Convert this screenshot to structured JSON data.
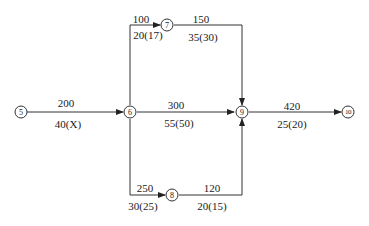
{
  "diagram": {
    "type": "network-diagram",
    "nodes": [
      {
        "id": "5",
        "label": "5"
      },
      {
        "id": "6",
        "label": "6"
      },
      {
        "id": "7",
        "label": "7"
      },
      {
        "id": "8",
        "label": "8"
      },
      {
        "id": "9",
        "label": "9"
      },
      {
        "id": "10",
        "label": "10"
      }
    ],
    "edges": [
      {
        "from": "5",
        "to": "6",
        "cost": "200",
        "duration": "40(X)"
      },
      {
        "from": "6",
        "to": "7",
        "cost": "100",
        "duration": "20(17)"
      },
      {
        "from": "7",
        "to": "9",
        "cost": "150",
        "duration": "35(30)"
      },
      {
        "from": "6",
        "to": "9",
        "cost": "300",
        "duration": "55(50)"
      },
      {
        "from": "6",
        "to": "8",
        "cost": "250",
        "duration": "30(25)"
      },
      {
        "from": "8",
        "to": "9",
        "cost": "120",
        "duration": "20(15)"
      },
      {
        "from": "9",
        "to": "10",
        "cost": "420",
        "duration": "25(20)"
      }
    ]
  }
}
